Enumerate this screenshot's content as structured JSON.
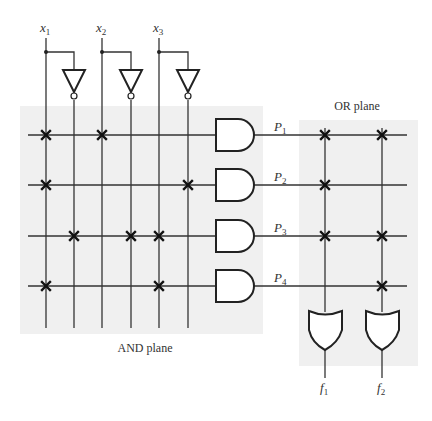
{
  "labels": {
    "and_plane": "AND plane",
    "or_plane": "OR plane"
  },
  "inputs": [
    {
      "name": "x",
      "sub": "1"
    },
    {
      "name": "x",
      "sub": "2"
    },
    {
      "name": "x",
      "sub": "3"
    }
  ],
  "products": [
    {
      "name": "P",
      "sub": "1"
    },
    {
      "name": "P",
      "sub": "2"
    },
    {
      "name": "P",
      "sub": "3"
    },
    {
      "name": "P",
      "sub": "4"
    }
  ],
  "outputs": [
    {
      "name": "f",
      "sub": "1"
    },
    {
      "name": "f",
      "sub": "2"
    }
  ],
  "and_plane_connections": {
    "columns": [
      "x1",
      "x1'",
      "x2",
      "x2'",
      "x3",
      "x3'"
    ],
    "P1": [
      "x1",
      "x2"
    ],
    "P2": [
      "x1",
      "x3'"
    ],
    "P3": [
      "x1'",
      "x2'",
      "x3"
    ],
    "P4": [
      "x1",
      "x3"
    ]
  },
  "or_plane_connections": {
    "f1": [
      "P1",
      "P2",
      "P3"
    ],
    "f2": [
      "P1",
      "P3",
      "P4"
    ]
  },
  "colors": {
    "plane_fill": "#f0f0f0",
    "line": "#333333",
    "background": "#ffffff"
  }
}
